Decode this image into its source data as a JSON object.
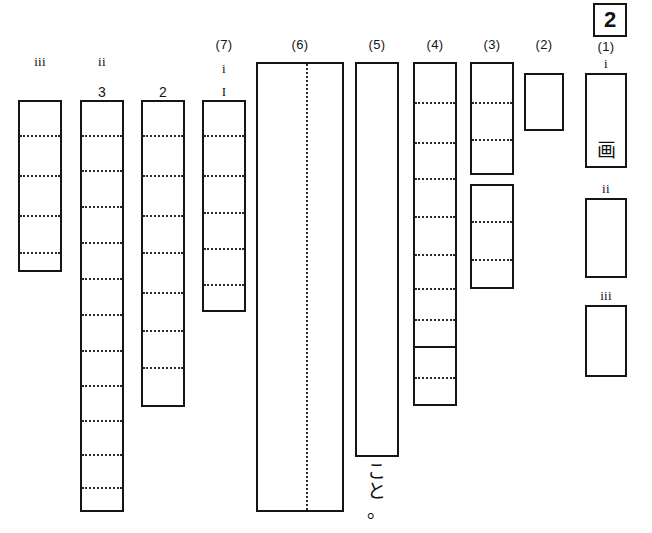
{
  "figure": {
    "marker": {
      "text": "2"
    },
    "columns": [
      {
        "id": "col-iii-left",
        "label_top": "iii",
        "label_mid": "",
        "label_num": "",
        "x": 18,
        "y": 100,
        "w": 44,
        "h": 172,
        "rules": [
          {
            "type": "dotted",
            "y": 33
          },
          {
            "type": "dotted",
            "y": 73
          },
          {
            "type": "dotted",
            "y": 113
          },
          {
            "type": "dotted",
            "y": 150
          }
        ]
      },
      {
        "id": "col-ii-3",
        "label_top": "ii",
        "label_num": "3",
        "x": 80,
        "y": 100,
        "w": 44,
        "h": 412,
        "rules": [
          {
            "type": "dotted",
            "y": 33
          },
          {
            "type": "dotted",
            "y": 68
          },
          {
            "type": "dotted",
            "y": 104
          },
          {
            "type": "dotted",
            "y": 140
          },
          {
            "type": "dotted",
            "y": 176
          },
          {
            "type": "dotted",
            "y": 212
          },
          {
            "type": "dotted",
            "y": 248
          },
          {
            "type": "dotted",
            "y": 283
          },
          {
            "type": "dotted",
            "y": 318
          },
          {
            "type": "dotted",
            "y": 352
          },
          {
            "type": "dotted",
            "y": 385
          }
        ]
      },
      {
        "id": "col-2",
        "label_top": "",
        "label_num": "2",
        "x": 141,
        "y": 100,
        "w": 44,
        "h": 307,
        "rules": [
          {
            "type": "dotted",
            "y": 33
          },
          {
            "type": "dotted",
            "y": 73
          },
          {
            "type": "dotted",
            "y": 113
          },
          {
            "type": "dotted",
            "y": 150
          },
          {
            "type": "dotted",
            "y": 190
          },
          {
            "type": "dotted",
            "y": 228
          },
          {
            "type": "dotted",
            "y": 265
          }
        ]
      },
      {
        "id": "col-7",
        "label_paren": "(7)",
        "label_top": "i",
        "label_num": "I",
        "x": 202,
        "y": 100,
        "w": 44,
        "h": 212,
        "rules": [
          {
            "type": "dotted",
            "y": 33
          },
          {
            "type": "dotted",
            "y": 73
          },
          {
            "type": "dotted",
            "y": 110
          },
          {
            "type": "dotted",
            "y": 146
          },
          {
            "type": "dotted",
            "y": 182
          }
        ]
      },
      {
        "id": "col-6",
        "label_paren": "(6)",
        "x": 256,
        "y": 62,
        "w": 88,
        "h": 450,
        "vrule_x": 48
      },
      {
        "id": "col-5",
        "label_paren": "(5)",
        "x": 355,
        "y": 62,
        "w": 44,
        "h": 395,
        "caption": [
          "こ",
          "と",
          "。"
        ]
      },
      {
        "id": "col-4",
        "label_paren": "(4)",
        "x": 413,
        "y": 62,
        "w": 44,
        "h": 344,
        "rules": [
          {
            "type": "dotted",
            "y": 38
          },
          {
            "type": "dotted",
            "y": 78
          },
          {
            "type": "dotted",
            "y": 114
          },
          {
            "type": "dotted",
            "y": 152
          },
          {
            "type": "dotted",
            "y": 190
          },
          {
            "type": "dotted",
            "y": 224
          },
          {
            "type": "dotted",
            "y": 255
          },
          {
            "type": "solid",
            "y": 282
          },
          {
            "type": "dotted",
            "y": 313
          }
        ]
      },
      {
        "id": "col-3-upper",
        "label_paren": "(3)",
        "x": 470,
        "y": 62,
        "w": 44,
        "h": 113,
        "rules": [
          {
            "type": "dotted",
            "y": 38
          },
          {
            "type": "dotted",
            "y": 75
          }
        ]
      },
      {
        "id": "col-3-lower",
        "x": 470,
        "y": 184,
        "w": 44,
        "h": 105,
        "rules": [
          {
            "type": "dotted",
            "y": 35
          },
          {
            "type": "dotted",
            "y": 73
          }
        ]
      },
      {
        "id": "col-2-single",
        "label_paren": "(2)",
        "x": 524,
        "y": 73,
        "w": 40,
        "h": 58,
        "rules": []
      },
      {
        "id": "col-1-i",
        "label_paren": "(1)",
        "label_top": "i",
        "x": 585,
        "y": 73,
        "w": 42,
        "h": 95,
        "glyph": "画"
      },
      {
        "id": "col-1-ii",
        "label_top": "ii",
        "x": 585,
        "y": 198,
        "w": 42,
        "h": 80
      },
      {
        "id": "col-1-iii",
        "label_top": "iii",
        "x": 585,
        "y": 305,
        "w": 42,
        "h": 72
      }
    ]
  }
}
